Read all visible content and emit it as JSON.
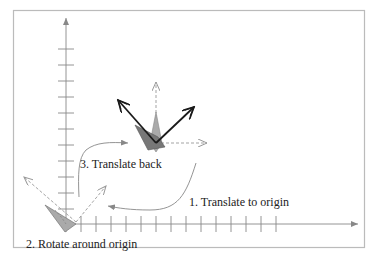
{
  "diagram": {
    "steps": [
      {
        "id": 1,
        "label": "1. Translate to origin"
      },
      {
        "id": 2,
        "label": "2. Rotate around origin"
      },
      {
        "id": 3,
        "label": "3. Translate back"
      }
    ],
    "colors": {
      "frame": "#bbbbbb",
      "axis": "#888888",
      "shape_fill": "#999999",
      "shape_fill_dark": "#777777",
      "arrow_dark": "#1a1a1a",
      "dashed_arrow": "#999999",
      "curve": "#888888",
      "text": "#222222"
    },
    "axes": {
      "x_ticks": 15,
      "y_ticks": 9
    }
  }
}
